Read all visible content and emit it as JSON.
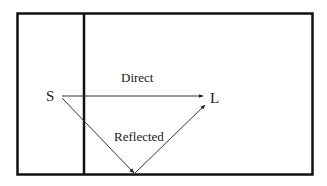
{
  "diagram": {
    "type": "signal-path",
    "labels": {
      "source": "S",
      "listener": "L",
      "direct": "Direct",
      "reflected": "Reflected"
    },
    "colors": {
      "border": "#111111",
      "path": "#333333",
      "text": "#1a1a1a",
      "background": "#ffffff"
    }
  }
}
